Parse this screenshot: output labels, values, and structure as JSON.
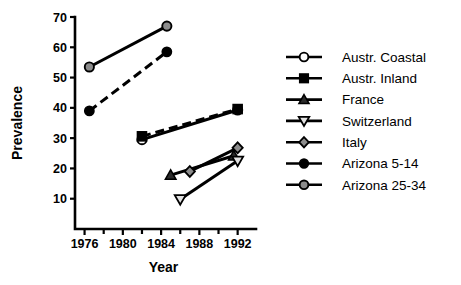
{
  "chart_data": {
    "type": "line",
    "title": "",
    "xlabel": "Year",
    "ylabel": "Prevalence",
    "xlim": [
      1975,
      1993.5
    ],
    "ylim": [
      0,
      70
    ],
    "xticks": [
      1976,
      1980,
      1984,
      1988,
      1992
    ],
    "xtick_labels": [
      "1976",
      "1980",
      "1984",
      "1988",
      "1992"
    ],
    "xminor_ticks": [
      1978,
      1982,
      1986,
      1990
    ],
    "yticks": [
      10,
      20,
      30,
      40,
      50,
      60,
      70
    ],
    "ytick_labels": [
      "10",
      "20",
      "30",
      "40",
      "50",
      "60",
      "70"
    ],
    "grid": false,
    "legend_position": "right",
    "series": [
      {
        "name": "Austr. Coastal",
        "marker": "open-circle",
        "linestyle": "solid",
        "x": [
          1982,
          1992
        ],
        "y": [
          29.5,
          39.3
        ]
      },
      {
        "name": "Austr. Inland",
        "marker": "filled-square",
        "linestyle": "dashed",
        "x": [
          1982,
          1992
        ],
        "y": [
          30.6,
          39.6
        ]
      },
      {
        "name": "France",
        "marker": "filled-triangle-up",
        "linestyle": "solid",
        "x": [
          1985,
          1991.6
        ],
        "y": [
          17.8,
          24.2
        ]
      },
      {
        "name": "Switzerland",
        "marker": "open-triangle-down",
        "linestyle": "solid",
        "x": [
          1986,
          1992
        ],
        "y": [
          9.8,
          22.5
        ]
      },
      {
        "name": "Italy",
        "marker": "gray-diamond",
        "linestyle": "solid",
        "x": [
          1987,
          1992
        ],
        "y": [
          19.0,
          26.8
        ]
      },
      {
        "name": "Arizona 5-14",
        "marker": "black-circle",
        "linestyle": "dashed",
        "x": [
          1976.5,
          1984.6
        ],
        "y": [
          39.0,
          58.5
        ]
      },
      {
        "name": "Arizona 25-34",
        "marker": "gray-circle",
        "linestyle": "solid",
        "x": [
          1976.5,
          1984.6
        ],
        "y": [
          53.5,
          67.0
        ]
      }
    ]
  },
  "legend": {
    "entries": [
      {
        "label": "Austr. Coastal",
        "marker": "open-circle"
      },
      {
        "label": "Austr. Inland",
        "marker": "filled-square"
      },
      {
        "label": "France",
        "marker": "filled-triangle-up"
      },
      {
        "label": "Switzerland",
        "marker": "open-triangle-down"
      },
      {
        "label": "Italy",
        "marker": "gray-diamond"
      },
      {
        "label": "Arizona 5-14",
        "marker": "black-circle"
      },
      {
        "label": "Arizona 25-34",
        "marker": "gray-circle"
      }
    ]
  },
  "colors": {
    "axis": "#000000",
    "line": "#000000",
    "gray_marker_fill": "#8c8c8c",
    "open_marker_fill": "#ffffff",
    "background": "#ffffff"
  }
}
